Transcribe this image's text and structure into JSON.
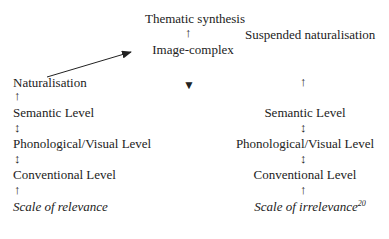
{
  "top": {
    "thematic_synthesis": "Thematic synthesis",
    "arrow_up": "↑",
    "image_complex": "Image-complex",
    "suspended_naturalisation": "Suspended naturalisation",
    "triangle": "▼"
  },
  "left_column": {
    "naturalisation": "Naturalisation",
    "levels": [
      "Semantic Level",
      "Phonological/Visual Level",
      "Conventional Level"
    ],
    "arrows": [
      "↑",
      "↕",
      "↕",
      "↑"
    ],
    "scale": "Scale of relevance"
  },
  "right_column": {
    "levels": [
      "Semantic Level",
      "Phonological/Visual Level",
      "Conventional Level"
    ],
    "arrows": [
      "↑",
      "↕",
      "↕",
      "↑"
    ],
    "scale": "Scale of irrelevance",
    "footnote": "20"
  }
}
